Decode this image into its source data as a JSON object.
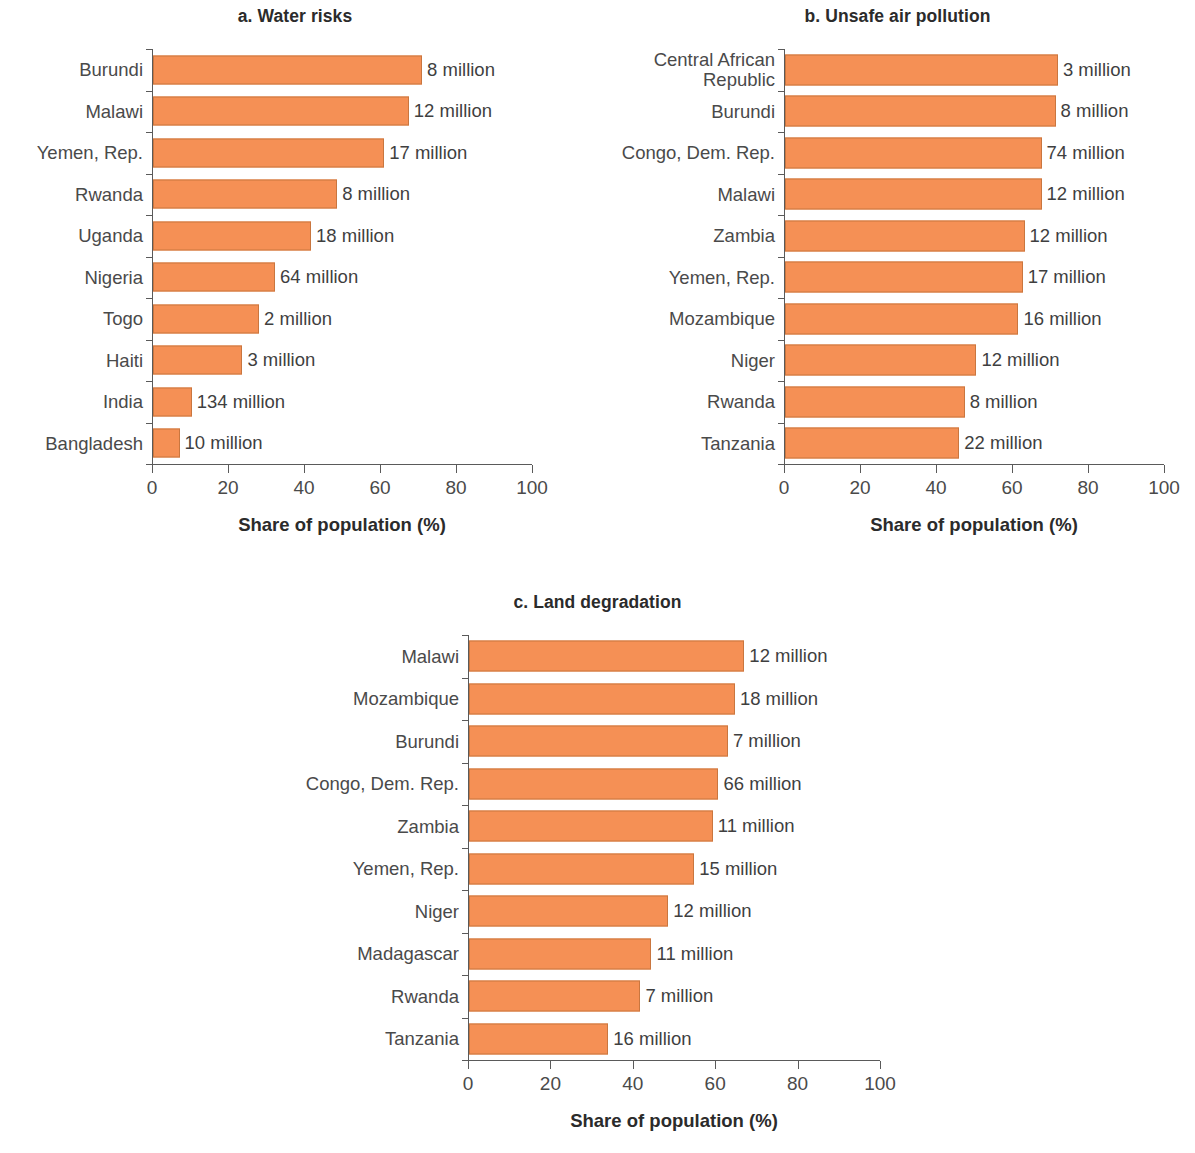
{
  "figure": {
    "accent_color": "#f59055",
    "bar_border_color": "#c9763f",
    "text_color": "#4a4a4a"
  },
  "panels": [
    {
      "id": "a",
      "title": "a. Water risks",
      "xlabel": "Share of population (%)",
      "xticks": [
        "0",
        "20",
        "40",
        "60",
        "80",
        "100"
      ]
    },
    {
      "id": "b",
      "title": "b. Unsafe air pollution",
      "xlabel": "Share of population (%)",
      "xticks": [
        "0",
        "20",
        "40",
        "60",
        "80",
        "100"
      ]
    },
    {
      "id": "c",
      "title": "c. Land degradation",
      "xlabel": "Share of population (%)",
      "xticks": [
        "0",
        "20",
        "40",
        "60",
        "80",
        "100"
      ]
    }
  ],
  "chart_data": [
    {
      "type": "bar",
      "orientation": "horizontal",
      "panel": "a",
      "title": "a. Water risks",
      "xlabel": "Share of population (%)",
      "ylabel": "",
      "xlim": [
        0,
        100
      ],
      "xticks": [
        0,
        20,
        40,
        60,
        80,
        100
      ],
      "grid": false,
      "legend": "none",
      "categories": [
        "Burundi",
        "Malawi",
        "Yemen, Rep.",
        "Rwanda",
        "Uganda",
        "Nigeria",
        "Togo",
        "Haiti",
        "India",
        "Bangladesh"
      ],
      "values": [
        71.0,
        67.5,
        61.0,
        48.6,
        41.7,
        32.2,
        28.0,
        23.6,
        10.2,
        7.0
      ],
      "data_labels": [
        "8 million",
        "12 million",
        "17 million",
        "8 million",
        "18 million",
        "64 million",
        "2 million",
        "3 million",
        "134 million",
        "10 million"
      ]
    },
    {
      "type": "bar",
      "orientation": "horizontal",
      "panel": "b",
      "title": "b. Unsafe air pollution",
      "xlabel": "Share of population (%)",
      "ylabel": "",
      "xlim": [
        0,
        100
      ],
      "xticks": [
        0,
        20,
        40,
        60,
        80,
        100
      ],
      "grid": false,
      "legend": "none",
      "categories": [
        "Central African\nRepublic",
        "Burundi",
        "Congo, Dem. Rep.",
        "Malawi",
        "Zambia",
        "Yemen, Rep.",
        "Mozambique",
        "Niger",
        "Rwanda",
        "Tanzania"
      ],
      "values": [
        72.0,
        71.4,
        67.7,
        67.7,
        63.2,
        62.7,
        61.6,
        50.5,
        47.4,
        46.0
      ],
      "data_labels": [
        "3 million",
        "8 million",
        "74 million",
        "12 million",
        "12 million",
        "17 million",
        "16 million",
        "12 million",
        "8 million",
        "22 million"
      ]
    },
    {
      "type": "bar",
      "orientation": "horizontal",
      "panel": "c",
      "title": "c. Land degradation",
      "xlabel": "Share of population (%)",
      "ylabel": "",
      "xlim": [
        0,
        100
      ],
      "xticks": [
        0,
        20,
        40,
        60,
        80,
        100
      ],
      "grid": false,
      "legend": "none",
      "categories": [
        "Malawi",
        "Mozambique",
        "Burundi",
        "Congo, Dem. Rep.",
        "Zambia",
        "Yemen, Rep.",
        "Niger",
        "Madagascar",
        "Rwanda",
        "Tanzania"
      ],
      "values": [
        67.0,
        64.7,
        63.0,
        60.7,
        59.3,
        54.8,
        48.5,
        44.4,
        41.7,
        33.9
      ],
      "data_labels": [
        "12 million",
        "18 million",
        "7 million",
        "66 million",
        "11 million",
        "15 million",
        "12 million",
        "11 million",
        "7 million",
        "16 million"
      ]
    }
  ]
}
